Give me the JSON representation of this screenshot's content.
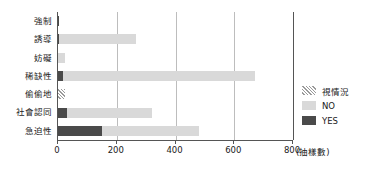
{
  "chart_data": {
    "type": "bar",
    "orientation": "horizontal",
    "stacked": true,
    "title": "",
    "xlabel": "(抽樣數)",
    "ylabel": "",
    "xlim": [
      0,
      800
    ],
    "xticks": [
      0,
      200,
      400,
      600,
      800
    ],
    "xtick_labels": [
      "0",
      "200",
      "400",
      "600",
      "800"
    ],
    "grid": true,
    "grid_axis": "x",
    "legend_position": "right",
    "categories": [
      "強制",
      "誘導",
      "妨礙",
      "稀缺性",
      "偷偷地",
      "社會認同",
      "急迫性"
    ],
    "series": [
      {
        "name": "YES",
        "color": "#4a4a4a",
        "pattern": "solid",
        "values": [
          3,
          5,
          0,
          18,
          0,
          30,
          150
        ]
      },
      {
        "name": "NO",
        "color": "#d9d9d9",
        "pattern": "solid",
        "values": [
          0,
          260,
          25,
          652,
          0,
          290,
          330
        ]
      },
      {
        "name": "視情況",
        "color": "#9a9a9a",
        "pattern": "diagonal-hatch",
        "values": [
          0,
          0,
          0,
          0,
          25,
          0,
          0
        ]
      }
    ],
    "legend_order": [
      "視情況",
      "NO",
      "YES"
    ]
  },
  "legend": {
    "items": [
      {
        "label": "視情況",
        "swatch": "hatch-swatch"
      },
      {
        "label": "NO",
        "swatch": "light-gray-swatch"
      },
      {
        "label": "YES",
        "swatch": "dark-gray-swatch"
      }
    ]
  },
  "axis": {
    "x_unit_label": "(抽樣數)"
  },
  "colors": {
    "yes": "#4a4a4a",
    "no": "#d9d9d9",
    "depends": "#9a9a9a",
    "grid": "#bdbdbd",
    "axis": "#555555",
    "text": "#1a1a1a",
    "background": "#ffffff"
  }
}
